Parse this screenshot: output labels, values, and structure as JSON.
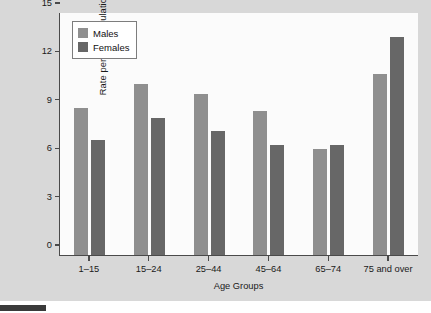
{
  "chart_data": {
    "type": "bar",
    "title": "",
    "xlabel": "Age Groups",
    "ylabel": "Rate per 100 Population",
    "categories": [
      "1–15",
      "15–24",
      "25–44",
      "45–64",
      "65–74",
      "75 and over"
    ],
    "series": [
      {
        "name": "Males",
        "color": "#8f8f8f",
        "values": [
          9.1,
          10.6,
          10.0,
          8.9,
          6.6,
          11.2
        ]
      },
      {
        "name": "Females",
        "color": "#676767",
        "values": [
          7.1,
          8.5,
          7.7,
          6.85,
          6.8,
          13.5
        ]
      }
    ],
    "ylim": [
      0,
      15
    ],
    "yticks": [
      0,
      3,
      6,
      9,
      12,
      15
    ],
    "ytick_labels": [
      "0",
      "3",
      "6",
      "9",
      "12",
      "15"
    ],
    "grid": false,
    "legend_position": "upper-left"
  },
  "legend": {
    "items": [
      {
        "label": "Males",
        "swatch": "males-swatch"
      },
      {
        "label": "Females",
        "swatch": "females-swatch"
      }
    ]
  },
  "colors": {
    "males": "#8f8f8f",
    "females": "#676767",
    "page_panel": "#d8d8d8",
    "plot_background": "#fbfbfb",
    "axis": "#4a4a4a",
    "text": "#1a1a1a"
  }
}
